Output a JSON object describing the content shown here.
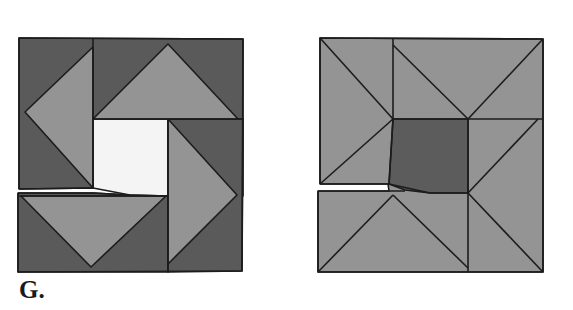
{
  "caption": "G.",
  "colors": {
    "dark": "#5a5a5a",
    "medium": "#949494",
    "light_center": "#f4f4f4",
    "dark_center": "#5c5c5c",
    "stroke": "#1c1c1c",
    "background": "#ffffff"
  },
  "blocks": [
    {
      "name": "left-quilt-block",
      "description": "Pinwheel-style quilt block with four medium-gray flying-geese triangles rotating around a white center square, dark gray background triangles; block is cut horizontally with a slight gap at lower-left",
      "center_fill": "white"
    },
    {
      "name": "right-quilt-block",
      "description": "Star-style quilt block with medium-gray triangles arranged around a dark gray center square; block is cut horizontally with a slight gap at lower-left",
      "center_fill": "dark gray"
    }
  ]
}
